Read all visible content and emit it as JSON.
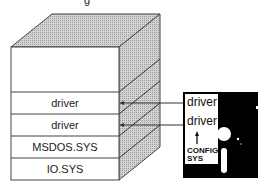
{
  "diagram": {
    "title_fragment": "g",
    "memory_stack": {
      "layers_top_to_bottom": [
        {
          "label": ""
        },
        {
          "label": "driver"
        },
        {
          "label": "driver"
        },
        {
          "label": "MSDOS.SYS"
        },
        {
          "label": "IO.SYS"
        }
      ]
    },
    "floppy_disk": {
      "label_lines": [
        "driver",
        "driver",
        "CONFIG",
        "SYS"
      ],
      "arrow": "up-arrow"
    },
    "arrows": [
      {
        "from": "floppy_disk.label_lines.0",
        "to": "memory_stack.layers_top_to_bottom.1"
      },
      {
        "from": "floppy_disk.label_lines.1",
        "to": "memory_stack.layers_top_to_bottom.2"
      }
    ],
    "colors": {
      "outline": "#444444",
      "top_face": "#c8c8c8",
      "side_face": "#bdbdbd",
      "disk": "#000000",
      "disk_label": "#ffffff"
    }
  }
}
